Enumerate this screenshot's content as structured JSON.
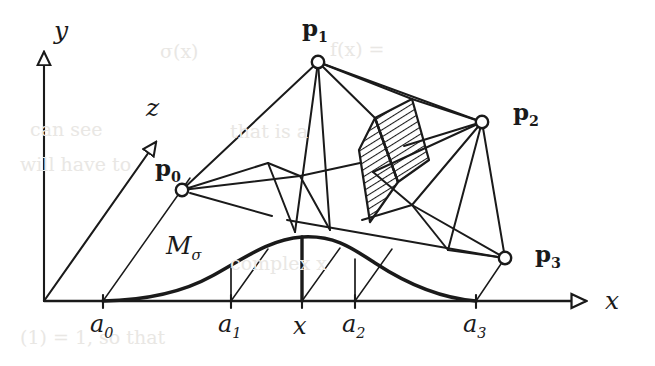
{
  "figure": {
    "ink_color": "#1a1a1a",
    "background_color": "#ffffff",
    "hatch_color": "#1a1a1a"
  },
  "axes": [
    {
      "name": "y-axis",
      "label": "y",
      "label_x": 54,
      "label_y": 18
    },
    {
      "name": "z-axis",
      "label": "z",
      "label_x": 146,
      "label_y": 95
    },
    {
      "name": "x-axis",
      "label": "x",
      "label_x": 605,
      "label_y": 288
    }
  ],
  "control_points": [
    {
      "name": "p0",
      "label": "p",
      "sub": "0",
      "cx": 182,
      "cy": 190,
      "label_x": 155,
      "label_y": 156
    },
    {
      "name": "p1",
      "label": "p",
      "sub": "1",
      "cx": 318,
      "cy": 62,
      "label_x": 302,
      "label_y": 16
    },
    {
      "name": "p2",
      "label": "p",
      "sub": "2",
      "cx": 482,
      "cy": 122,
      "label_x": 513,
      "label_y": 100
    },
    {
      "name": "p3",
      "label": "p",
      "sub": "3",
      "cx": 505,
      "cy": 258,
      "label_x": 535,
      "label_y": 242
    }
  ],
  "ticks": [
    {
      "name": "a0",
      "label": "a",
      "sub": "0",
      "x": 103,
      "label_x": 90,
      "label_y": 312
    },
    {
      "name": "a1",
      "label": "a",
      "sub": "1",
      "x": 231,
      "label_x": 218,
      "label_y": 312
    },
    {
      "name": "x",
      "label": "x",
      "sub": "",
      "x": 302,
      "label_x": 293,
      "label_y": 314
    },
    {
      "name": "a2",
      "label": "a",
      "sub": "2",
      "x": 355,
      "label_x": 342,
      "label_y": 312
    },
    {
      "name": "a3",
      "label": "a",
      "sub": "3",
      "x": 476,
      "label_x": 463,
      "label_y": 312
    }
  ],
  "curve": {
    "name": "M-sigma",
    "label": "M",
    "sub": "σ",
    "label_x": 166,
    "label_y": 233,
    "baseline_y": 301,
    "peak_x": 302,
    "peak_y": 237
  },
  "origin": {
    "x": 44,
    "y": 301
  },
  "hatched_region": {
    "name": "slab-cross-section",
    "hatch_angle_deg": 60,
    "hatch_spacing_px": 5
  },
  "ghost_text": [
    {
      "text": "f(x)  =",
      "x": 330,
      "y": 48
    },
    {
      "text": "σ(x)",
      "x": 160,
      "y": 50
    },
    {
      "text": "can  see",
      "x": 30,
      "y": 128
    },
    {
      "text": "will  have  to",
      "x": 20,
      "y": 163
    },
    {
      "text": "that  is  a",
      "x": 230,
      "y": 130
    },
    {
      "text": "complex  x",
      "x": 230,
      "y": 262
    },
    {
      "text": "(1) = 1,  so  that",
      "x": 20,
      "y": 336
    }
  ]
}
